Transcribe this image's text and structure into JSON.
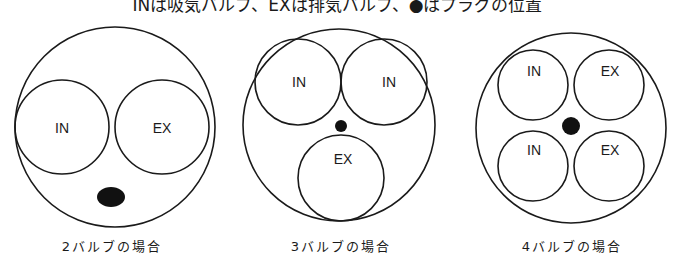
{
  "title": "INは吸気バルブ、EXは排気バルブ、●はプラグの位置",
  "colors": {
    "stroke": "#1a1a1a",
    "background": "#ffffff",
    "plug": "#111111"
  },
  "diagrams": [
    {
      "caption": "2バルブの場合",
      "valve_count": 2,
      "valves": [
        {
          "label": "IN",
          "type": "intake"
        },
        {
          "label": "EX",
          "type": "exhaust"
        }
      ],
      "plug_icon": "spark-plug-dot"
    },
    {
      "caption": "3バルブの場合",
      "valve_count": 3,
      "valves": [
        {
          "label": "IN",
          "type": "intake"
        },
        {
          "label": "IN",
          "type": "intake"
        },
        {
          "label": "EX",
          "type": "exhaust"
        }
      ],
      "plug_icon": "spark-plug-dot"
    },
    {
      "caption": "4バルブの場合",
      "valve_count": 4,
      "valves": [
        {
          "label": "IN",
          "type": "intake"
        },
        {
          "label": "EX",
          "type": "exhaust"
        },
        {
          "label": "IN",
          "type": "intake"
        },
        {
          "label": "EX",
          "type": "exhaust"
        }
      ],
      "plug_icon": "spark-plug-dot"
    }
  ]
}
